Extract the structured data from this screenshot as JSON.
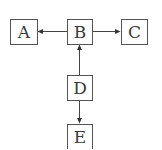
{
  "diagram": {
    "type": "flow",
    "nodes": [
      {
        "id": "A",
        "label": "A",
        "x": 10,
        "y": 19,
        "w": 27,
        "h": 25
      },
      {
        "id": "B",
        "label": "B",
        "x": 67,
        "y": 19,
        "w": 25,
        "h": 25
      },
      {
        "id": "C",
        "label": "C",
        "x": 121,
        "y": 19,
        "w": 26,
        "h": 25
      },
      {
        "id": "D",
        "label": "D",
        "x": 67,
        "y": 75,
        "w": 25,
        "h": 25
      },
      {
        "id": "E",
        "label": "E",
        "x": 67,
        "y": 124,
        "w": 25,
        "h": 25
      }
    ],
    "edges": [
      {
        "from": "B",
        "to": "A"
      },
      {
        "from": "B",
        "to": "C"
      },
      {
        "from": "D",
        "to": "B"
      },
      {
        "from": "D",
        "to": "E"
      }
    ],
    "colors": {
      "stroke": "#555555",
      "text": "#3a3a3a",
      "background": "#ffffff"
    }
  }
}
